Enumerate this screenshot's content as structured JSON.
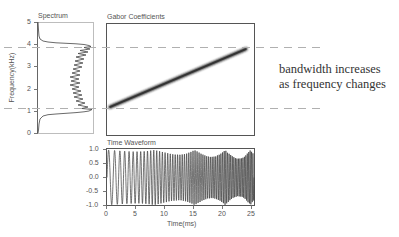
{
  "chart_data": [
    {
      "type": "line",
      "title": "Spectrum",
      "ylabel": "Frequency(kHz)",
      "xlabel": "",
      "ylim": [
        0,
        5
      ],
      "yticks": [
        "0",
        "1",
        "2",
        "3",
        "4",
        "5"
      ],
      "orientation": "vertical-spectrum",
      "description": "Magnitude spectrum plotted against frequency; flat near zero outside 1.2–3.8 kHz band, oscillating ripple inside the band",
      "band_khz": [
        1.2,
        3.8
      ]
    },
    {
      "type": "heatmap",
      "title": "Gabor Coefficients",
      "description": "Linear chirp ridge rising from ~1.2 kHz at t=0 to ~3.8 kHz at t=25 ms",
      "ridge": {
        "x": [
          0,
          25
        ],
        "y": [
          1.2,
          3.8
        ]
      },
      "reference_lines_khz": [
        1.2,
        3.8
      ]
    },
    {
      "type": "line",
      "title": "Time Waveform",
      "xlabel": "Time(ms)",
      "ylabel": "",
      "xlim": [
        0,
        25
      ],
      "ylim": [
        -1.0,
        1.0
      ],
      "xticks": [
        "0",
        "5",
        "10",
        "15",
        "20",
        "25"
      ],
      "yticks": [
        "1.0",
        "0.5",
        "0.0",
        "-0.5",
        "-1.0"
      ],
      "description": "Chirp signal of amplitude ~1, frequency increasing over time"
    }
  ],
  "spectrum": {
    "title": "Spectrum",
    "ylabel": "Frequency(kHz)",
    "yticks": [
      "5",
      "4",
      "3",
      "2",
      "1",
      "0"
    ]
  },
  "gabor": {
    "title": "Gabor Coefficients"
  },
  "waveform": {
    "title": "Time Waveform",
    "xlabel": "Time(ms)",
    "yticks": [
      "1.0",
      "0.5",
      "0.0",
      "-0.5",
      "-1.0"
    ],
    "xticks": [
      "0",
      "5",
      "10",
      "15",
      "20",
      "25"
    ]
  },
  "annotation": {
    "line1": "bandwidth increases",
    "line2": "as frequency changes"
  }
}
